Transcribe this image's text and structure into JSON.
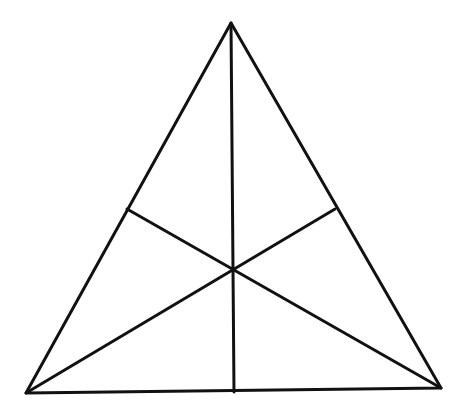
{
  "diagram": {
    "type": "triangle-medians",
    "background": "#ffffff",
    "stroke_color": "#111111",
    "stroke_width": 3,
    "vertices": {
      "apex": {
        "x": 231,
        "y": 23
      },
      "bottom_left": {
        "x": 26,
        "y": 393
      },
      "bottom_right": {
        "x": 441,
        "y": 388
      }
    },
    "midpoints": {
      "left_side": {
        "x": 127,
        "y": 209
      },
      "right_side": {
        "x": 335,
        "y": 209
      },
      "base": {
        "x": 234,
        "y": 392
      }
    },
    "centroid": {
      "x": 232,
      "y": 269
    },
    "medians": [
      {
        "name": "apex-to-base-midpoint",
        "from": "apex",
        "to": "base"
      },
      {
        "name": "bottom-left-to-right-side-midpoint",
        "from": "bottom_left",
        "to": "right_side"
      },
      {
        "name": "bottom-right-to-left-side-midpoint",
        "from": "bottom_right",
        "to": "left_side"
      }
    ]
  }
}
